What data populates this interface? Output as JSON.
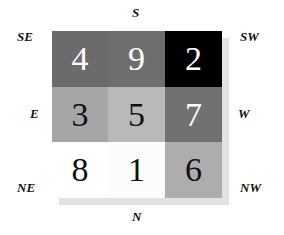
{
  "labels": {
    "top": "S",
    "bottom": "N",
    "left_mid": "E",
    "right_mid": "W",
    "top_left": "SE",
    "top_right": "SW",
    "bottom_left": "NE",
    "bottom_right": "NW"
  },
  "grid": {
    "rows": [
      [
        {
          "value": "4",
          "bg": "#6b6b6b",
          "fg": "#ffffff"
        },
        {
          "value": "9",
          "bg": "#6e6e6e",
          "fg": "#ffffff"
        },
        {
          "value": "2",
          "bg": "#000000",
          "fg": "#ffffff"
        }
      ],
      [
        {
          "value": "3",
          "bg": "#a6a6a6",
          "fg": "#111111"
        },
        {
          "value": "5",
          "bg": "#b9b9b9",
          "fg": "#111111"
        },
        {
          "value": "7",
          "bg": "#717171",
          "fg": "#ffffff"
        }
      ],
      [
        {
          "value": "8",
          "bg": "#ffffff",
          "fg": "#111111"
        },
        {
          "value": "1",
          "bg": "#fcfcfc",
          "fg": "#111111"
        },
        {
          "value": "6",
          "bg": "#adadad",
          "fg": "#111111"
        }
      ]
    ]
  }
}
